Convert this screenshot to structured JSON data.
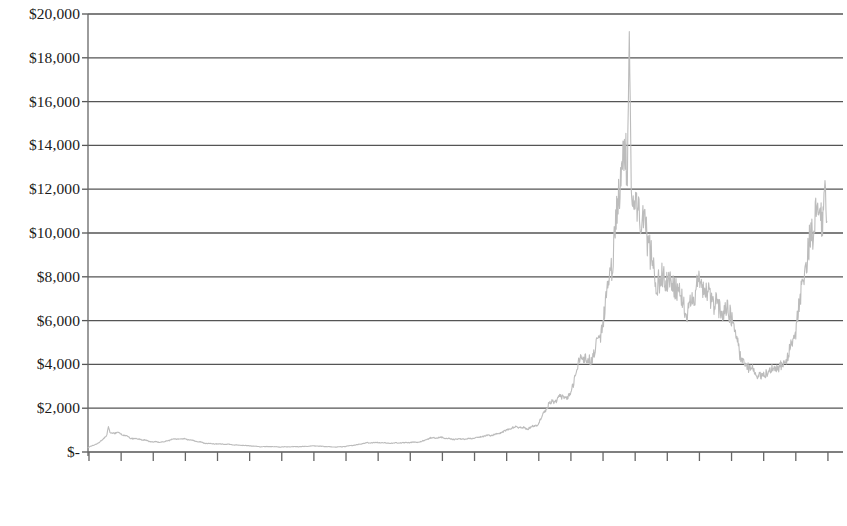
{
  "chart_data": {
    "type": "line",
    "title": "",
    "subtitle": "",
    "xlabel": "",
    "ylabel": "",
    "grid": true,
    "legend": false,
    "legend_position": "none",
    "line_color": "#bcbcbc",
    "gridline_color": "#555555",
    "axis_color": "#666666",
    "text_color": "#1a1a1a",
    "background_color": "#ffffff",
    "ylim": [
      0,
      20000
    ],
    "ytick_values": [
      20000,
      18000,
      16000,
      14000,
      12000,
      10000,
      8000,
      6000,
      4000,
      2000,
      0
    ],
    "ytick_labels": [
      "$20,000",
      "$18,000",
      "$16,000",
      "$14,000",
      "$12,000",
      "$10,000",
      "$8,000",
      "$6,000",
      "$4,000",
      "$2,000",
      "$-"
    ],
    "xtick_labels": [
      "Oct-13",
      "Jan-14",
      "Apr-14",
      "Jul-14",
      "Oct-14",
      "Jan-15",
      "Apr-15",
      "Jul-15",
      "Oct-15",
      "Jan-16",
      "Apr-16",
      "Jul-16",
      "Oct-16",
      "Jan-17",
      "Apr-17",
      "Jul-17",
      "Oct-17",
      "Jan-18",
      "Apr-18",
      "Jul-18",
      "Oct-18",
      "Jan-19",
      "Apr-19",
      "Jul-19"
    ],
    "xlim_labels": [
      "Oct-13",
      "Jul-19"
    ],
    "series": [
      {
        "name": "Price",
        "x": [
          "Oct-13",
          "Nov-13",
          "Dec-13",
          "Jan-14",
          "Feb-14",
          "Mar-14",
          "Apr-14",
          "May-14",
          "Jun-14",
          "Jul-14",
          "Aug-14",
          "Sep-14",
          "Oct-14",
          "Nov-14",
          "Dec-14",
          "Jan-15",
          "Feb-15",
          "Mar-15",
          "Apr-15",
          "May-15",
          "Jun-15",
          "Jul-15",
          "Aug-15",
          "Sep-15",
          "Oct-15",
          "Nov-15",
          "Dec-15",
          "Jan-16",
          "Feb-16",
          "Mar-16",
          "Apr-16",
          "May-16",
          "Jun-16",
          "Jul-16",
          "Aug-16",
          "Sep-16",
          "Oct-16",
          "Nov-16",
          "Dec-16",
          "Jan-17",
          "Feb-17",
          "Mar-17",
          "Apr-17",
          "May-17",
          "Jun-17",
          "Jul-17",
          "Aug-17",
          "Sep-17",
          "Oct-17",
          "Nov-17",
          "Dec-17",
          "Jan-18",
          "Feb-18",
          "Mar-18",
          "Apr-18",
          "May-18",
          "Jun-18",
          "Jul-18",
          "Aug-18",
          "Sep-18",
          "Oct-18",
          "Nov-18",
          "Dec-18",
          "Jan-19",
          "Feb-19",
          "Mar-19",
          "Apr-19",
          "May-19",
          "Jun-19",
          "Jul-19"
        ],
        "values": [
          200,
          400,
          900,
          850,
          620,
          580,
          460,
          450,
          600,
          600,
          500,
          400,
          370,
          350,
          320,
          290,
          240,
          250,
          230,
          240,
          250,
          280,
          250,
          230,
          250,
          320,
          420,
          430,
          400,
          420,
          430,
          450,
          650,
          660,
          580,
          600,
          620,
          720,
          800,
          970,
          1150,
          1080,
          1250,
          2150,
          2500,
          2550,
          4300,
          4200,
          5600,
          8800,
          14000,
          11500,
          10300,
          8000,
          7900,
          7500,
          6400,
          7700,
          7050,
          6600,
          6400,
          4200,
          3800,
          3450,
          3800,
          4000,
          5300,
          8500,
          11000,
          10400
        ],
        "key_points": [
          {
            "label": "Late-2013 peak",
            "x": "Dec-13",
            "value": 1150
          },
          {
            "label": "2015 trough",
            "x": "Jan-15",
            "value": 220
          },
          {
            "label": "Jun-2017 local peak",
            "x": "Jun-17",
            "value": 3000
          },
          {
            "label": "All-time high",
            "x": "Dec-17",
            "value": 19200
          },
          {
            "label": "2018 rebound",
            "x": "May-18",
            "value": 9900
          },
          {
            "label": "Dec-2018 bottom",
            "x": "Dec-18",
            "value": 3350
          },
          {
            "label": "2019 peak",
            "x": "Jun-19",
            "value": 12400
          },
          {
            "label": "Final value",
            "x": "Jul-19",
            "value": 10200
          }
        ]
      }
    ]
  }
}
